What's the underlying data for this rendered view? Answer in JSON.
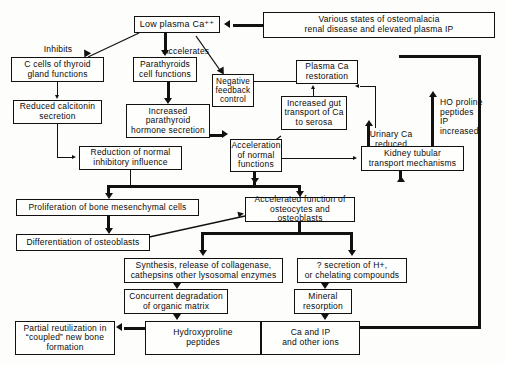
{
  "diagram": {
    "line_color": "#12110f",
    "background": "#fdfdfb",
    "nodes": [
      {
        "id": "low_plasma_ca",
        "text": "Low plasma Ca⁺⁺"
      },
      {
        "id": "various_states",
        "text": "Various states of osteomalacia\nrenal disease and elevated plasma IP"
      },
      {
        "id": "c_cells",
        "text": "C cells of thyroid\ngland functions"
      },
      {
        "id": "parathyroids",
        "text": "Parathyroids\ncell functions"
      },
      {
        "id": "negative_feedback",
        "text": "Negative\nfeedback\ncontrol"
      },
      {
        "id": "plasma_ca_restoration",
        "text": "Plasma Ca\nrestoration"
      },
      {
        "id": "reduced_calcitonin",
        "text": "Reduced calcitonin\nsecretion"
      },
      {
        "id": "increased_pth",
        "text": "Increased\nparathyroid\nhormone secretion"
      },
      {
        "id": "increased_gut",
        "text": "Increased gut\ntransport of Ca\nto serosa"
      },
      {
        "id": "reduction_inhibitory",
        "text": "Reduction of normal\ninhibitory influence"
      },
      {
        "id": "acceleration_normal",
        "text": "Acceleration\nof normal\nfunctions"
      },
      {
        "id": "kidney_tubular",
        "text": "Kidney tubular\ntransport mechanisms"
      },
      {
        "id": "proliferation",
        "text": "Proliferation of bone mesenchymal cells"
      },
      {
        "id": "accelerated_function",
        "text": "Accelerated function of\nosteocytes and osteoblasts"
      },
      {
        "id": "differentiation",
        "text": "Differentiation of osteoblasts"
      },
      {
        "id": "synthesis_release",
        "text": "Synthesis, release of collagenase,\ncathepsins other lysosomal enzymes"
      },
      {
        "id": "secretion_h",
        "text": "? secretion of H+,\nor chelating compounds"
      },
      {
        "id": "concurrent_degrad",
        "text": "Concurrent degradation\nof organic matrix"
      },
      {
        "id": "mineral_resorption",
        "text": "Mineral\nresorption"
      },
      {
        "id": "partial_reutilization",
        "text": "Partial reutilization in\n“coupled” new bone\nformation"
      },
      {
        "id": "hydroxyproline",
        "text": "Hydroxyproline\npeptides"
      },
      {
        "id": "ca_ip_ions",
        "text": "Ca  and  IP\nand other ions"
      }
    ],
    "labels": [
      {
        "id": "inhibits",
        "text": "Inhibits"
      },
      {
        "id": "accelerates",
        "text": "Accelerates"
      },
      {
        "id": "urinary_ca",
        "text": "Urinary Ca\nreduced"
      },
      {
        "id": "ho_proline",
        "text": "HO proline\npeptides\nIP\nincreased"
      }
    ]
  }
}
